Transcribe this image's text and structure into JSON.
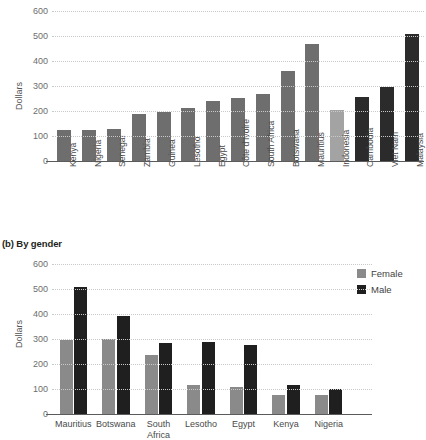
{
  "figure": {
    "panel_b_title": "(b) By gender"
  },
  "chart_data": [
    {
      "id": "panel-a",
      "type": "bar",
      "title": "",
      "xlabel": "",
      "ylabel": "Dollars",
      "ylim": [
        0,
        600
      ],
      "yticks": [
        0,
        100,
        200,
        300,
        400,
        500,
        600
      ],
      "grid": true,
      "legend": "none",
      "categories": [
        "Kenya",
        "Nigeria",
        "Senegal",
        "Zambia",
        "Guinea",
        "Lesotho",
        "Egypt",
        "Côte d'Ivoire",
        "South Africa",
        "Botswana",
        "Mauritius",
        "Indonesia",
        "Cambodia",
        "Viet Nam",
        "Malaysia"
      ],
      "values": [
        125,
        125,
        130,
        190,
        197,
        212,
        242,
        253,
        268,
        360,
        470,
        205,
        258,
        295,
        510
      ],
      "bar_colors": [
        "#6e6e6e",
        "#6e6e6e",
        "#6e6e6e",
        "#6e6e6e",
        "#6e6e6e",
        "#6e6e6e",
        "#6e6e6e",
        "#6e6e6e",
        "#6e6e6e",
        "#6e6e6e",
        "#6e6e6e",
        "#a3a3a3",
        "#2b2b2b",
        "#2b2b2b",
        "#2b2b2b"
      ]
    },
    {
      "id": "panel-b",
      "type": "bar",
      "title": "(b) By gender",
      "xlabel": "",
      "ylabel": "Dollars",
      "ylim": [
        0,
        600
      ],
      "yticks": [
        0,
        100,
        200,
        300,
        400,
        500,
        600
      ],
      "grid": true,
      "legend": "top-right",
      "categories": [
        "Mauritius",
        "Botswana",
        "South\nAfrica",
        "Lesotho",
        "Egypt",
        "Kenya",
        "Nigeria"
      ],
      "series": [
        {
          "name": "Female",
          "color": "#8a8a8a",
          "values": [
            297,
            300,
            235,
            115,
            110,
            75,
            78
          ]
        },
        {
          "name": "Male",
          "color": "#1f1f1f",
          "values": [
            508,
            392,
            283,
            288,
            275,
            115,
            100
          ]
        }
      ]
    }
  ],
  "colors": {
    "bar_gray": "#6e6e6e",
    "bar_light_gray": "#a3a3a3",
    "bar_dark": "#2b2b2b",
    "female": "#8a8a8a",
    "male": "#1f1f1f",
    "grid": "#c9c9c9",
    "axis": "#5b5b5b"
  }
}
